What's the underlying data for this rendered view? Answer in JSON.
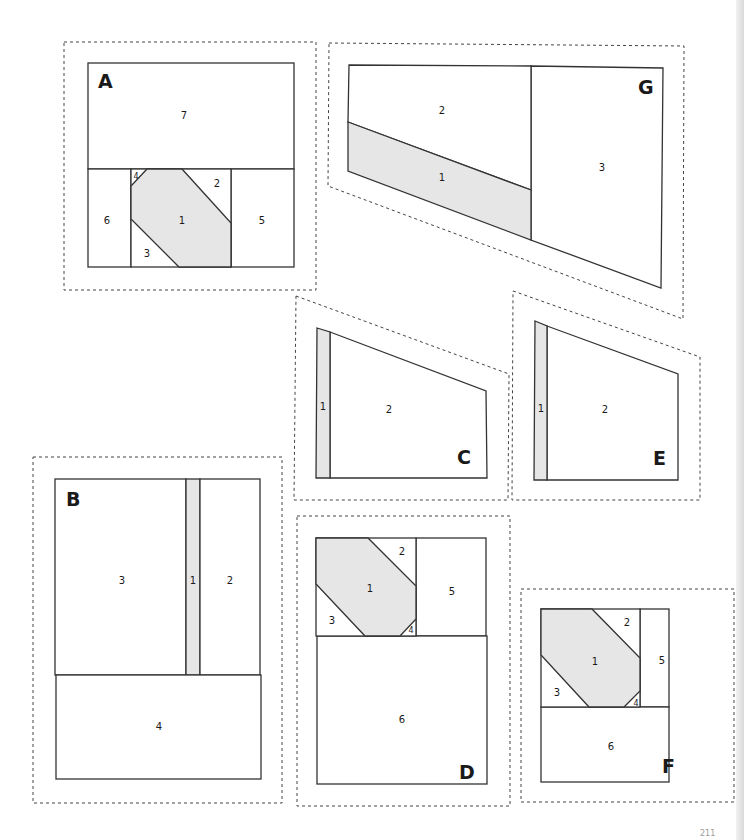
{
  "page": {
    "number": "211"
  },
  "colors": {
    "shaded_piece": "#e6e6e6",
    "line": "#333333",
    "background": "#ffffff"
  },
  "blocks": {
    "A": {
      "letter": "A",
      "pieces": [
        "1",
        "2",
        "3",
        "4",
        "5",
        "6",
        "7"
      ],
      "shaded": "1"
    },
    "B": {
      "letter": "B",
      "pieces": [
        "1",
        "2",
        "3",
        "4"
      ],
      "shaded": "1"
    },
    "C": {
      "letter": "C",
      "pieces": [
        "1",
        "2"
      ],
      "shaded": "1"
    },
    "D": {
      "letter": "D",
      "pieces": [
        "1",
        "2",
        "3",
        "4",
        "5",
        "6"
      ],
      "shaded": "1"
    },
    "E": {
      "letter": "E",
      "pieces": [
        "1",
        "2"
      ],
      "shaded": "1"
    },
    "F": {
      "letter": "F",
      "pieces": [
        "1",
        "2",
        "3",
        "4",
        "5",
        "6"
      ],
      "shaded": "1"
    },
    "G": {
      "letter": "G",
      "pieces": [
        "1",
        "2",
        "3"
      ],
      "shaded": "1"
    }
  }
}
